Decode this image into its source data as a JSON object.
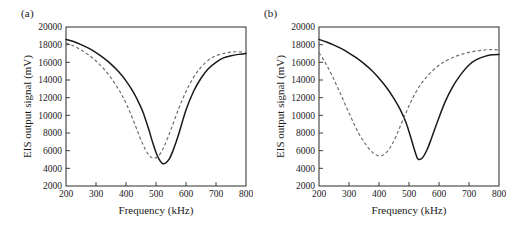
{
  "figure": {
    "panel_a_label": "(a)",
    "panel_b_label": "(b)"
  },
  "chart_data": [
    {
      "panel": "(a)",
      "type": "line",
      "title": "",
      "xlabel": "Frequency (kHz)",
      "ylabel": "EIS output signal (mV)",
      "xlim": [
        200,
        800
      ],
      "ylim": [
        2000,
        20000
      ],
      "xticks": [
        200,
        300,
        400,
        500,
        600,
        700,
        800
      ],
      "yticks": [
        2000,
        4000,
        6000,
        8000,
        10000,
        12000,
        14000,
        16000,
        18000,
        20000
      ],
      "grid": false,
      "legend": "none",
      "series": [
        {
          "name": "solid",
          "style": "solid",
          "color": "#1a1a1a",
          "x": [
            200,
            225,
            250,
            275,
            300,
            325,
            350,
            375,
            400,
            425,
            450,
            460,
            475,
            490,
            500,
            510,
            520,
            530,
            545,
            560,
            575,
            600,
            625,
            650,
            675,
            700,
            725,
            750,
            775,
            800
          ],
          "y": [
            18600,
            18350,
            18000,
            17600,
            17100,
            16500,
            15800,
            14950,
            13900,
            12600,
            10900,
            10050,
            8500,
            6800,
            5800,
            5050,
            4600,
            4550,
            5100,
            6300,
            7800,
            10600,
            12700,
            14200,
            15300,
            16000,
            16500,
            16750,
            16900,
            17000
          ]
        },
        {
          "name": "dashed",
          "style": "dashed",
          "color": "#6e6e6e",
          "x": [
            200,
            225,
            250,
            275,
            300,
            325,
            350,
            375,
            390,
            405,
            420,
            435,
            450,
            465,
            480,
            490,
            500,
            515,
            530,
            550,
            575,
            600,
            625,
            650,
            675,
            700,
            725,
            750,
            775,
            800
          ],
          "y": [
            18200,
            17850,
            17400,
            16850,
            16150,
            15300,
            14250,
            12950,
            12050,
            11000,
            9800,
            8500,
            7200,
            6100,
            5350,
            5150,
            5200,
            5700,
            6700,
            8400,
            10700,
            12700,
            14300,
            15450,
            16250,
            16750,
            17000,
            17150,
            17200,
            17100
          ]
        }
      ]
    },
    {
      "panel": "(b)",
      "type": "line",
      "title": "",
      "xlabel": "Frequency (kHz)",
      "ylabel": "EIS output signal (mV)",
      "xlim": [
        200,
        800
      ],
      "ylim": [
        2000,
        20000
      ],
      "xticks": [
        200,
        300,
        400,
        500,
        600,
        700,
        800
      ],
      "yticks": [
        2000,
        4000,
        6000,
        8000,
        10000,
        12000,
        14000,
        16000,
        18000,
        20000
      ],
      "grid": false,
      "legend": "none",
      "series": [
        {
          "name": "solid",
          "style": "solid",
          "color": "#1a1a1a",
          "x": [
            200,
            225,
            250,
            275,
            300,
            325,
            350,
            375,
            400,
            425,
            450,
            470,
            490,
            505,
            520,
            530,
            545,
            560,
            575,
            595,
            620,
            645,
            670,
            700,
            725,
            750,
            775,
            800
          ],
          "y": [
            18600,
            18300,
            17950,
            17550,
            17050,
            16500,
            15850,
            15100,
            14200,
            13150,
            11900,
            10700,
            9200,
            7600,
            5900,
            5050,
            5200,
            6100,
            7400,
            9300,
            11500,
            13200,
            14500,
            15700,
            16300,
            16650,
            16850,
            16900
          ]
        },
        {
          "name": "dashed",
          "style": "dashed",
          "color": "#6e6e6e",
          "x": [
            200,
            215,
            230,
            245,
            260,
            275,
            290,
            305,
            320,
            335,
            350,
            365,
            380,
            395,
            410,
            425,
            440,
            455,
            470,
            490,
            510,
            535,
            560,
            590,
            620,
            650,
            680,
            710,
            740,
            770,
            800
          ],
          "y": [
            17100,
            16300,
            15400,
            14400,
            13300,
            12200,
            11000,
            9900,
            8800,
            7800,
            7000,
            6300,
            5750,
            5450,
            5450,
            5800,
            6500,
            7500,
            8700,
            10300,
            11800,
            13300,
            14400,
            15400,
            16100,
            16600,
            16950,
            17200,
            17350,
            17450,
            17400
          ]
        }
      ]
    }
  ]
}
